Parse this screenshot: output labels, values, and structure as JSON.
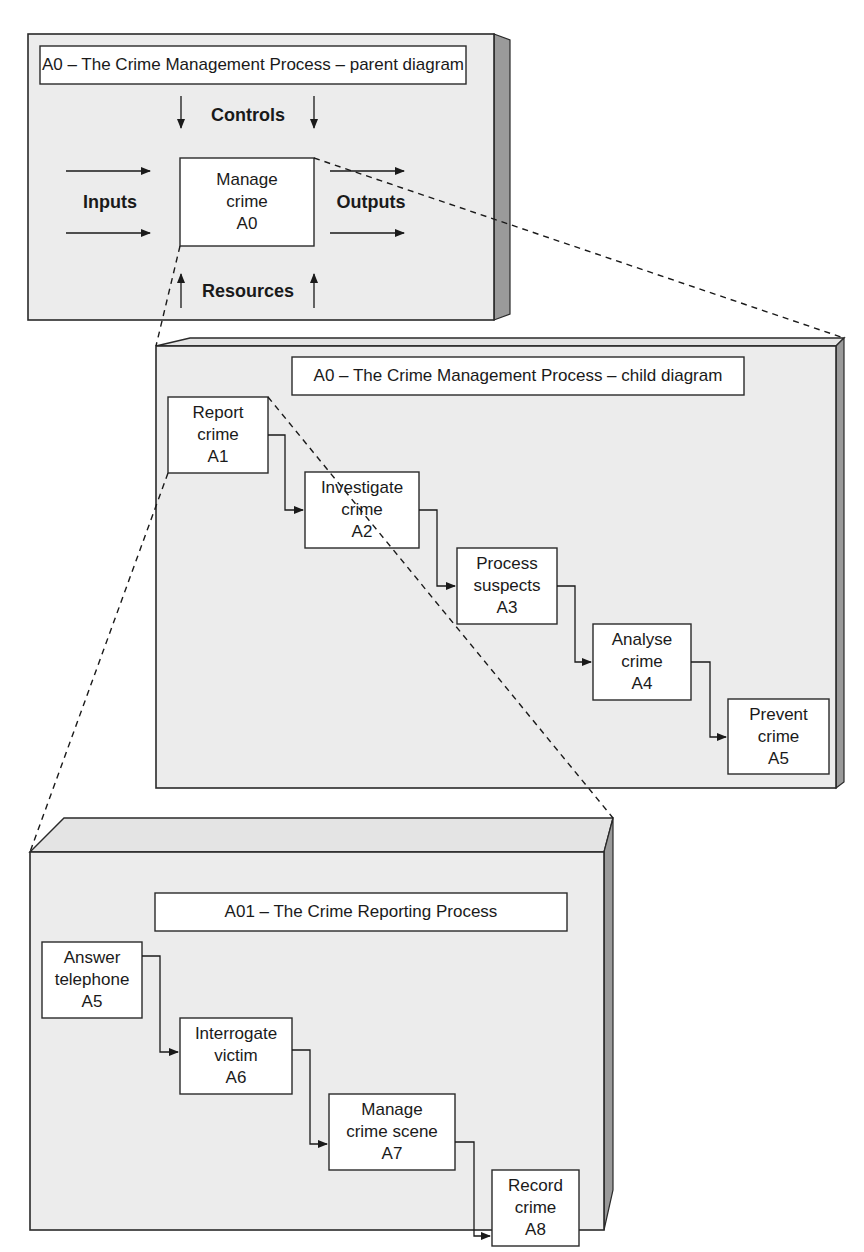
{
  "parent_diagram": {
    "title": "A0 – The Crime Management Process – parent diagram",
    "center_box": {
      "line1": "Manage",
      "line2": "crime",
      "code": "A0"
    },
    "labels": {
      "controls": "Controls",
      "inputs": "Inputs",
      "outputs": "Outputs",
      "resources": "Resources"
    }
  },
  "child_diagram": {
    "title": "A0 – The Crime Management Process – child diagram",
    "activities": [
      {
        "line1": "Report",
        "line2": "crime",
        "code": "A1"
      },
      {
        "line1": "Investigate",
        "line2": "crime",
        "code": "A2"
      },
      {
        "line1": "Process",
        "line2": "suspects",
        "code": "A3"
      },
      {
        "line1": "Analyse",
        "line2": "crime",
        "code": "A4"
      },
      {
        "line1": "Prevent",
        "line2": "crime",
        "code": "A5"
      }
    ]
  },
  "reporting_diagram": {
    "title": "A01 – The Crime Reporting Process",
    "activities": [
      {
        "line1": "Answer",
        "line2": "telephone",
        "code": "A5"
      },
      {
        "line1": "Interrogate",
        "line2": "victim",
        "code": "A6"
      },
      {
        "line1": "Manage",
        "line2": "crime scene",
        "code": "A7"
      },
      {
        "line1": "Record",
        "line2": "crime",
        "code": "A8"
      }
    ]
  }
}
